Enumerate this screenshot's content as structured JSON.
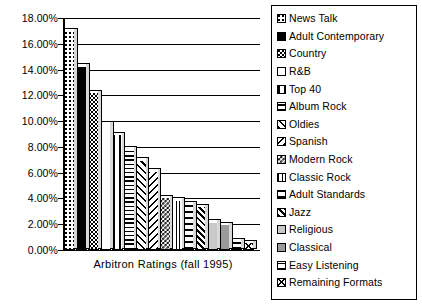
{
  "chart_data": {
    "type": "bar",
    "title": "",
    "xlabel": "Arbitron  Ratings  (fall  1995)",
    "ylabel": "",
    "ylim": [
      0,
      18
    ],
    "grid": true,
    "legend_position": "right",
    "y_ticks": [
      "18.00%",
      "16.00%",
      "14.00%",
      "12.00%",
      "10.00%",
      "8.00%",
      "6.00%",
      "4.00%",
      "2.00%",
      "0.00%"
    ],
    "y_tick_values": [
      18,
      16,
      14,
      12,
      10,
      8,
      6,
      4,
      2,
      0
    ],
    "categories": [
      "News  Talk",
      "Adult  Contemporary",
      "Country",
      "R&B",
      "Top  40",
      "Album  Rock",
      "Oldies",
      "Spanish",
      "Modern  Rock",
      "Classic  Rock",
      "Adult  Standards",
      "Jazz",
      "Religious",
      "Classical",
      "Easy  Listening",
      "Remaining  Formats"
    ],
    "values": [
      17.0,
      14.3,
      12.25,
      9.8,
      9.0,
      7.9,
      7.0,
      6.15,
      4.1,
      3.9,
      3.6,
      3.4,
      2.2,
      2.0,
      0.75,
      0.6
    ],
    "patterns": [
      "p-dots-sparse",
      "p-solid",
      "p-dots-dense",
      "p-empty",
      "p-vert-wide",
      "p-horiz",
      "p-diag-fwd",
      "p-diag-back",
      "p-checker",
      "p-vert-narrow",
      "p-horiz-wide",
      "p-diag-fwd-dense",
      "p-gray-light",
      "p-gray-mid",
      "p-horiz-split",
      "p-cross"
    ]
  },
  "legend": {
    "items": [
      {
        "label": "News  Talk",
        "pattern": "p-dots-sparse"
      },
      {
        "label": "Adult  Contemporary",
        "pattern": "p-solid"
      },
      {
        "label": "Country",
        "pattern": "p-dots-dense"
      },
      {
        "label": "R&B",
        "pattern": "p-empty"
      },
      {
        "label": "Top  40",
        "pattern": "p-vert-wide"
      },
      {
        "label": "Album  Rock",
        "pattern": "p-horiz"
      },
      {
        "label": "Oldies",
        "pattern": "p-diag-fwd"
      },
      {
        "label": "Spanish",
        "pattern": "p-diag-back"
      },
      {
        "label": "Modern  Rock",
        "pattern": "p-checker"
      },
      {
        "label": "Classic  Rock",
        "pattern": "p-vert-narrow"
      },
      {
        "label": "Adult  Standards",
        "pattern": "p-horiz-wide"
      },
      {
        "label": "Jazz",
        "pattern": "p-diag-fwd-dense"
      },
      {
        "label": "Religious",
        "pattern": "p-gray-light"
      },
      {
        "label": "Classical",
        "pattern": "p-gray-mid"
      },
      {
        "label": "Easy  Listening",
        "pattern": "p-horiz-split"
      },
      {
        "label": "Remaining  Formats",
        "pattern": "p-cross"
      }
    ]
  },
  "axis": {
    "x_title": "Arbitron  Ratings  (fall  1995)"
  }
}
